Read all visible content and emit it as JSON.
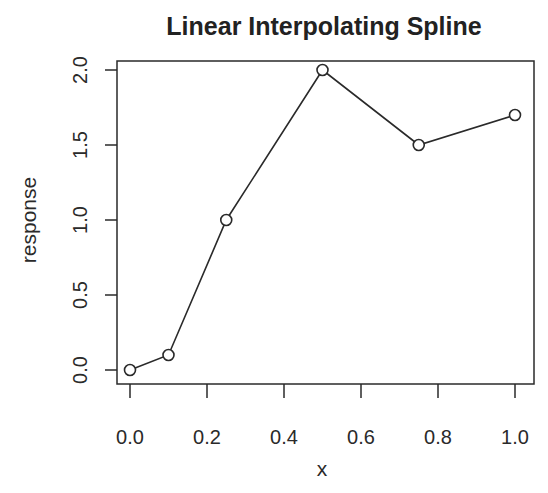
{
  "chart_data": {
    "type": "line",
    "title": "Linear Interpolating Spline",
    "xlabel": "x",
    "ylabel": "response",
    "x": [
      0.0,
      0.1,
      0.25,
      0.5,
      0.75,
      1.0
    ],
    "series": [
      {
        "name": "response",
        "values": [
          0.0,
          0.1,
          1.0,
          2.0,
          1.5,
          1.7
        ],
        "marker": "open-circle",
        "line": "solid"
      }
    ],
    "xticks": [
      "0.0",
      "0.2",
      "0.4",
      "0.6",
      "0.8",
      "1.0"
    ],
    "yticks": [
      "0.0",
      "0.5",
      "1.0",
      "1.5",
      "2.0"
    ],
    "xlim": [
      0.0,
      1.0
    ],
    "ylim": [
      0.0,
      2.0
    ],
    "grid": false,
    "legend": null
  },
  "colors": {
    "line": "#2a2a2a",
    "background": "#ffffff"
  }
}
